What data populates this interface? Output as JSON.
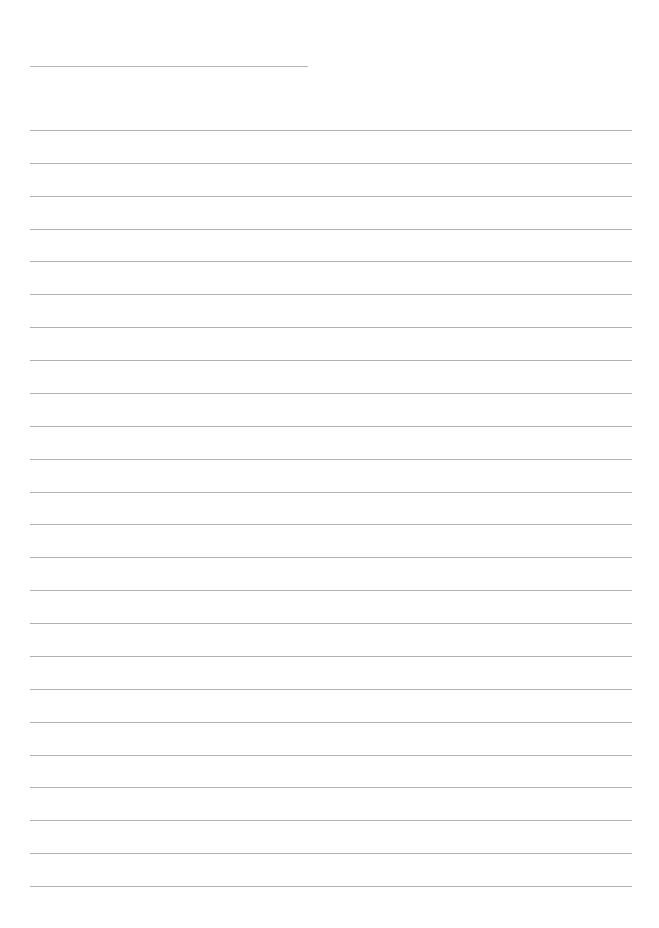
{
  "page": {
    "type": "lined-writing-sheet",
    "width": 659,
    "height": 928,
    "background_color": "#ffffff"
  },
  "header_line": {
    "x_start": 30,
    "x_end": 308,
    "y": 66,
    "color": "#b4b4b4"
  },
  "ruled_lines": {
    "count": 24,
    "x_start": 30,
    "x_end": 632,
    "first_y": 130,
    "last_y": 886,
    "color": "#b0b0b0",
    "thickness": 1
  },
  "text_content": []
}
